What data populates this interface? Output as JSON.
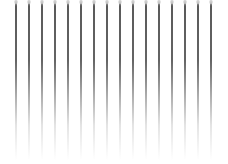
{
  "image": {
    "description": "Sixteen evenly spaced vertical gray lines fading to white toward the bottom",
    "line_count": 16,
    "line_color": "#5a5a5a",
    "background_color": "#ffffff",
    "lines": [
      {
        "x": 15
      },
      {
        "x": 28
      },
      {
        "x": 41
      },
      {
        "x": 54
      },
      {
        "x": 67
      },
      {
        "x": 80
      },
      {
        "x": 93
      },
      {
        "x": 106
      },
      {
        "x": 119
      },
      {
        "x": 132
      },
      {
        "x": 145
      },
      {
        "x": 158
      },
      {
        "x": 171
      },
      {
        "x": 184
      },
      {
        "x": 197
      },
      {
        "x": 210
      }
    ]
  }
}
